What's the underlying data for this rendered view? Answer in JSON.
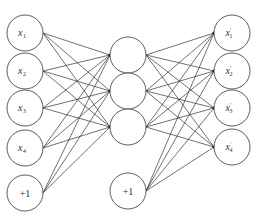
{
  "diagram": {
    "type": "autoencoder-network",
    "input_layer": {
      "nodes": [
        {
          "id": "x1",
          "var": "x",
          "sub": "1",
          "cx": 25,
          "cy": 33
        },
        {
          "id": "x2",
          "var": "x",
          "sub": "2",
          "cx": 25,
          "cy": 71
        },
        {
          "id": "x3",
          "var": "x",
          "sub": "3",
          "cx": 25,
          "cy": 108
        },
        {
          "id": "x4",
          "var": "x",
          "sub": "4",
          "cx": 25,
          "cy": 148
        }
      ],
      "bias": {
        "id": "b1",
        "label": "+1",
        "cx": 25,
        "cy": 193
      }
    },
    "hidden_layer": {
      "nodes": [
        {
          "id": "h1",
          "cx": 128,
          "cy": 55
        },
        {
          "id": "h2",
          "cx": 128,
          "cy": 91
        },
        {
          "id": "h3",
          "cx": 128,
          "cy": 127
        }
      ],
      "bias": {
        "id": "b2",
        "label": "+1",
        "cx": 128,
        "cy": 191
      }
    },
    "output_layer": {
      "nodes": [
        {
          "id": "y1",
          "var": "x",
          "prime": "'",
          "sub": "1",
          "cx": 232,
          "cy": 33
        },
        {
          "id": "y2",
          "var": "x",
          "prime": "'",
          "sub": "2",
          "cx": 232,
          "cy": 71
        },
        {
          "id": "y3",
          "var": "x",
          "prime": "'",
          "sub": "3",
          "cx": 232,
          "cy": 108
        },
        {
          "id": "y4",
          "var": "x",
          "prime": "'",
          "sub": "4",
          "cx": 232,
          "cy": 147
        }
      ]
    },
    "node_radius": 18,
    "colors": {
      "stroke": "#4a4a4a",
      "edge": "#333333",
      "arrowhead": "#111111",
      "background": "#ffffff"
    }
  }
}
